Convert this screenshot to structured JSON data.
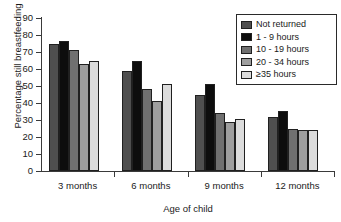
{
  "chart_data": {
    "type": "bar",
    "title": "",
    "xlabel": "Age of child",
    "ylabel": "Percentage still breastfeeding",
    "categories": [
      "3 months",
      "6 months",
      "9 months",
      "12 months"
    ],
    "ylim": [
      0,
      90
    ],
    "yticks": [
      0,
      10,
      20,
      30,
      40,
      50,
      60,
      70,
      80,
      90
    ],
    "ytick_labels": [
      "0",
      "10",
      "20",
      "30",
      "40",
      "50",
      "60",
      "70",
      "80",
      "90"
    ],
    "grid": false,
    "legend_position": "top-right",
    "series": [
      {
        "name": "Not returned",
        "color": "#4f4f4f",
        "values": [
          74.5,
          59.0,
          45.0,
          31.5
        ]
      },
      {
        "name": "1 - 9 hours",
        "color": "#0d0d0d",
        "values": [
          76.5,
          64.5,
          51.0,
          35.5
        ]
      },
      {
        "name": "10 - 19 hours",
        "color": "#707070",
        "values": [
          71.0,
          48.0,
          34.0,
          24.5
        ]
      },
      {
        "name": "20 - 34 hours",
        "color": "#9e9e9e",
        "values": [
          63.0,
          41.0,
          29.0,
          24.0
        ]
      },
      {
        "name": "≥35 hours",
        "color": "#dcdcdc",
        "values": [
          65.0,
          51.0,
          30.5,
          24.0
        ]
      }
    ]
  },
  "legend": {
    "items": [
      {
        "label": "Not returned"
      },
      {
        "label": "1 - 9 hours"
      },
      {
        "label": "10 - 19 hours"
      },
      {
        "label": "20 - 34 hours"
      },
      {
        "label": "≥35 hours"
      }
    ]
  }
}
